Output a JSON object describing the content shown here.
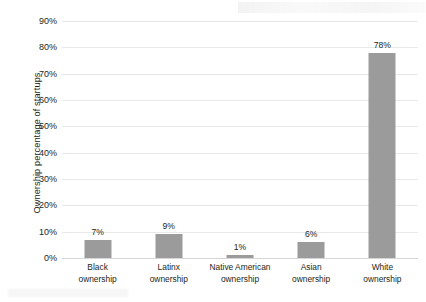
{
  "chart_data": {
    "type": "bar",
    "title": "",
    "xlabel": "",
    "ylabel": "Ownership percentage of startups",
    "categories": [
      "Black ownership",
      "Latinx ownership",
      "Native American ownership",
      "Asian ownership",
      "White ownership"
    ],
    "category_lines": [
      [
        "Black",
        "ownership"
      ],
      [
        "Latinx",
        "ownership"
      ],
      [
        "Native American",
        "ownership"
      ],
      [
        "Asian",
        "ownership"
      ],
      [
        "White",
        "ownership"
      ]
    ],
    "values": [
      7,
      9,
      1,
      6,
      78
    ],
    "value_labels": [
      "7%",
      "9%",
      "1%",
      "6%",
      "78%"
    ],
    "ylim": [
      0,
      90
    ],
    "ytick_values": [
      0,
      10,
      20,
      30,
      40,
      50,
      60,
      70,
      80,
      90
    ],
    "ytick_labels": [
      "0%",
      "10%",
      "20%",
      "30%",
      "40%",
      "50%",
      "60%",
      "70%",
      "80%",
      "90%"
    ],
    "grid": true,
    "legend": "none",
    "series": [
      {
        "name": "Ownership percentage of startups",
        "values": [
          7,
          9,
          1,
          6,
          78
        ]
      }
    ],
    "colors": {
      "bar": "#9b9b9b",
      "gridline": "#e9e9ea",
      "baseline": "#d6d6d7",
      "text": "#231f20",
      "background": "#ffffff"
    }
  }
}
